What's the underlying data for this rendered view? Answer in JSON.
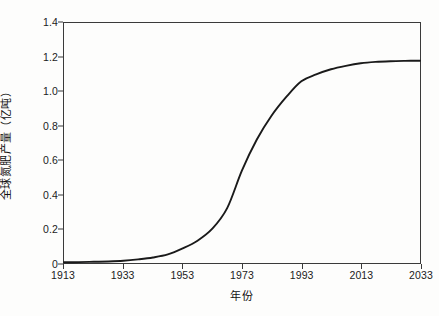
{
  "chart_data": {
    "type": "line",
    "title": "",
    "xlabel": "年份",
    "ylabel": "全球氮肥产量（亿吨）",
    "xlim": [
      1913,
      2033
    ],
    "ylim": [
      0,
      1.4
    ],
    "grid": false,
    "legend": null,
    "xticks": [
      "1913",
      "1933",
      "1953",
      "1973",
      "1993",
      "2013",
      "2033"
    ],
    "xtick_values": [
      1913,
      1933,
      1953,
      1973,
      1993,
      2013,
      2033
    ],
    "yticks": [
      "0",
      "0.2",
      "0.4",
      "0.6",
      "0.8",
      "1.0",
      "1.2",
      "1.4"
    ],
    "ytick_values": [
      0,
      0.2,
      0.4,
      0.6,
      0.8,
      1.0,
      1.2,
      1.4
    ],
    "line_color": "#1a1a1a",
    "line_width": 1.9,
    "series": [
      {
        "name": "全球氮肥产量",
        "x": [
          1913,
          1918,
          1923,
          1928,
          1933,
          1938,
          1943,
          1948,
          1953,
          1958,
          1963,
          1968,
          1973,
          1978,
          1983,
          1988,
          1993,
          1998,
          2003,
          2008,
          2013,
          2018,
          2023,
          2028,
          2033
        ],
        "values": [
          0.004,
          0.005,
          0.007,
          0.009,
          0.013,
          0.021,
          0.032,
          0.05,
          0.085,
          0.13,
          0.2,
          0.32,
          0.54,
          0.72,
          0.86,
          0.97,
          1.06,
          1.1,
          1.13,
          1.15,
          1.165,
          1.173,
          1.177,
          1.179,
          1.18
        ]
      }
    ]
  }
}
